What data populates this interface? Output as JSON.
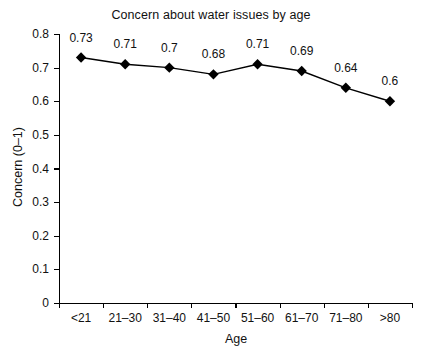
{
  "chart_data": {
    "type": "line",
    "title": "Concern about water issues by age",
    "xlabel": "Age",
    "ylabel": "Concern (0–1)",
    "categories": [
      "<21",
      "21–30",
      "31–40",
      "41–50",
      "51–60",
      "61–70",
      "71–80",
      ">80"
    ],
    "values": [
      0.73,
      0.71,
      0.7,
      0.68,
      0.71,
      0.69,
      0.64,
      0.6
    ],
    "point_labels": [
      "0.73",
      "0.71",
      "0.7",
      "0.68",
      "0.71",
      "0.69",
      "0.64",
      "0.6"
    ],
    "ylim": [
      0,
      0.8
    ],
    "ytick_labels": [
      "0.8",
      "0.7",
      "0.6",
      "0.5",
      "0.4",
      "0.3",
      "0.2",
      "0.1",
      "0"
    ],
    "ytick_values": [
      0.8,
      0.7,
      0.6,
      0.5,
      0.4,
      0.3,
      0.2,
      0.1,
      0
    ],
    "grid": false,
    "legend": false,
    "marker": "diamond",
    "marker_color": "#000000",
    "line_color": "#000000",
    "background_color": "#ffffff"
  }
}
